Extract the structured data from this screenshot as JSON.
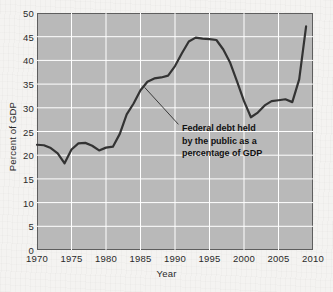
{
  "figure": {
    "background_color": "#f4f3f1",
    "plot_background_color": "#b9b9b9",
    "grid_color": "#ffffff",
    "line_color": "#333333",
    "frame_color": "#5e5e5e"
  },
  "annotation": {
    "line1": "Federal debt held",
    "line2": "by the public as a",
    "line3": "percentage of GDP"
  },
  "chart_data": {
    "type": "line",
    "title": "",
    "xlabel": "Year",
    "ylabel": "Percent of GDP",
    "xlim": [
      1970,
      2010
    ],
    "ylim": [
      0,
      50
    ],
    "xticks": [
      1970,
      1975,
      1980,
      1985,
      1990,
      1995,
      2000,
      2005,
      2010
    ],
    "yticks": [
      0,
      5,
      10,
      15,
      20,
      25,
      30,
      35,
      40,
      45,
      50
    ],
    "grid": true,
    "legend": "none",
    "annotations": [
      {
        "text": "Federal debt held by the public as a percentage of GDP",
        "points_to_x": 1985.6,
        "points_to_y": 34.3,
        "text_x": 1990.5,
        "text_y": 26.5
      }
    ],
    "series": [
      {
        "name": "Federal debt held by the public as a percentage of GDP",
        "x": [
          1970,
          1971,
          1972,
          1973,
          1974,
          1975,
          1976,
          1977,
          1978,
          1979,
          1980,
          1981,
          1982,
          1983,
          1984,
          1985,
          1986,
          1987,
          1988,
          1989,
          1990,
          1991,
          1992,
          1993,
          1994,
          1995,
          1996,
          1997,
          1998,
          1999,
          2000,
          2001,
          2002,
          2003,
          2004,
          2005,
          2006,
          2007,
          2008,
          2009
        ],
        "values": [
          22.2,
          22.1,
          21.5,
          20.4,
          18.3,
          21.2,
          22.5,
          22.6,
          22.0,
          21.0,
          21.6,
          21.8,
          24.5,
          28.6,
          30.9,
          33.7,
          35.5,
          36.2,
          36.4,
          36.8,
          38.8,
          41.5,
          44.0,
          44.8,
          44.6,
          44.5,
          44.3,
          42.3,
          39.5,
          35.5,
          31.4,
          28.0,
          29.0,
          30.5,
          31.4,
          31.6,
          31.8,
          31.2,
          36.0,
          47.2
        ]
      }
    ]
  }
}
